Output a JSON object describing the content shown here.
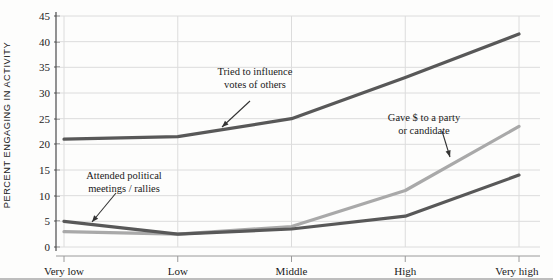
{
  "chart_data": {
    "type": "line",
    "title": "",
    "xlabel": "",
    "ylabel": "PERCENT ENGAGING IN ACTIVITY",
    "categories": [
      "Very low",
      "Low",
      "Middle",
      "High",
      "Very high"
    ],
    "ylim": [
      0,
      45
    ],
    "yticks": [
      0,
      5,
      10,
      15,
      20,
      25,
      30,
      35,
      40,
      45
    ],
    "ytick_labels": [
      "0",
      "5",
      "10",
      "15",
      "20",
      "25",
      "30",
      "35",
      "40",
      "45"
    ],
    "grid": true,
    "legend": "annotations",
    "series": [
      {
        "name": "Tried to influence votes of others",
        "color": "#585858",
        "values": [
          21,
          21.5,
          25,
          33,
          41.5
        ]
      },
      {
        "name": "Gave $ to a party or candidate",
        "color": "#a9a9a9",
        "values": [
          3,
          2.5,
          4,
          11,
          23.5
        ]
      },
      {
        "name": "Attended political meetings/rallies",
        "color": "#585858",
        "values": [
          5,
          2.5,
          3.5,
          6,
          14
        ]
      }
    ],
    "annotations": [
      {
        "id": "annot-influence",
        "text": "Tried to influence\nvotes of others",
        "x": 255,
        "y": 66
      },
      {
        "id": "annot-gave-money",
        "text": "Gave $ to a party\nor candidate",
        "x": 424,
        "y": 112
      },
      {
        "id": "annot-meetings",
        "text": "Attended political\nmeetings / rallies",
        "x": 124,
        "y": 170
      }
    ]
  }
}
